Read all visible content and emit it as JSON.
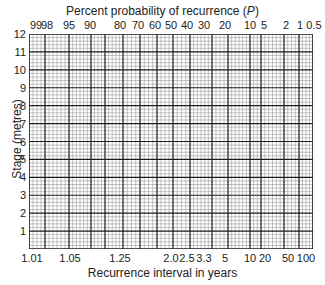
{
  "chart_data": {
    "type": "probability-paper",
    "title": "Percent probability of recurrence (P)",
    "xlabel": "Recurrence interval in years",
    "ylabel": "Stage (metres)",
    "ylim": [
      0,
      12
    ],
    "yticks": [
      1,
      2,
      3,
      4,
      5,
      6,
      7,
      8,
      9,
      10,
      11,
      12
    ],
    "top_axis": {
      "label": "Percent probability of recurrence (P)",
      "ticks": [
        "99",
        "98",
        "95",
        "90",
        "80",
        "70",
        "60",
        "50",
        "40",
        "30",
        "20",
        "10",
        "5",
        "2",
        "1",
        "0.5"
      ]
    },
    "bottom_axis": {
      "label": "Recurrence interval in years",
      "ticks": [
        "1.01",
        "1.05",
        "1.25",
        "2.0",
        "2.5",
        "3.3",
        "5",
        "10",
        "20",
        "50",
        "100"
      ]
    },
    "grid": true,
    "series": []
  },
  "labels": {
    "top_title_main": "Percent probability of recurrence (",
    "top_title_var": "P",
    "top_title_end": ")",
    "xlabel": "Recurrence interval in years",
    "ylabel": "Stage (metres)"
  },
  "top_ticks": [
    {
      "t": "99",
      "x": 36
    },
    {
      "t": "98",
      "x": 47
    },
    {
      "t": "95",
      "x": 69
    },
    {
      "t": "90",
      "x": 90
    },
    {
      "t": "80",
      "x": 120
    },
    {
      "t": "70",
      "x": 138
    },
    {
      "t": "60",
      "x": 155
    },
    {
      "t": "50",
      "x": 171
    },
    {
      "t": "40",
      "x": 187
    },
    {
      "t": "30",
      "x": 204
    },
    {
      "t": "20",
      "x": 225
    },
    {
      "t": "10",
      "x": 250
    },
    {
      "t": "5",
      "x": 264
    },
    {
      "t": "2",
      "x": 286
    },
    {
      "t": "1",
      "x": 300
    },
    {
      "t": "0.5",
      "x": 314
    }
  ],
  "bottom_ticks": [
    {
      "t": "1.01",
      "x": 32
    },
    {
      "t": "1.05",
      "x": 70
    },
    {
      "t": "1.25",
      "x": 120
    },
    {
      "t": "2.0",
      "x": 171
    },
    {
      "t": "2.5",
      "x": 187
    },
    {
      "t": "3.3",
      "x": 204
    },
    {
      "t": "5",
      "x": 225
    },
    {
      "t": "10",
      "x": 250
    },
    {
      "t": "20",
      "x": 265
    },
    {
      "t": "50",
      "x": 288
    },
    {
      "t": "100",
      "x": 306
    }
  ],
  "major_x": [
    0,
    16,
    40,
    62,
    76,
    94,
    111,
    128,
    144,
    161,
    183,
    199,
    221,
    232,
    255,
    270,
    284
  ],
  "colors": {
    "major": "#1a1a1a",
    "minor": "#9a9a9a",
    "bg": "#ffffff"
  }
}
